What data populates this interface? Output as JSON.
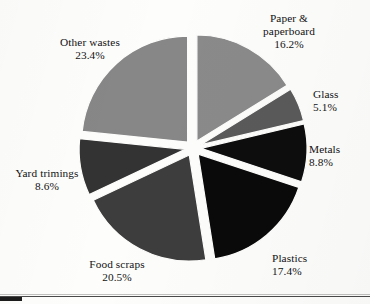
{
  "figure": {
    "background_color": "#fdfdfc",
    "text_color": "#121212"
  },
  "artifacts": {
    "bottom_rule_color": "#4a4a4a",
    "corner_mark_color": "#1c1c1c"
  },
  "chart_data": {
    "type": "pie",
    "title": "",
    "subtitle": "",
    "xlabel": "",
    "ylabel": "",
    "legend_position": "none",
    "grid": false,
    "exploded": true,
    "start_angle_deg": 0,
    "direction": "clockwise",
    "units": "percent",
    "total": 100.0,
    "labels": [
      "Paper & paperboard",
      "Glass",
      "Metals",
      "Plastics",
      "Food scraps",
      "Yard trimings",
      "Other wastes"
    ],
    "values": [
      16.2,
      5.1,
      8.8,
      17.4,
      20.5,
      8.6,
      23.4
    ],
    "colors": [
      "#8a8a8a",
      "#5a5a5a",
      "#0d0d0d",
      "#0a0a0a",
      "#3d3d3d",
      "#333333",
      "#878787"
    ],
    "slices": [
      {
        "label": "Paper & paperboard",
        "label_line1": "Paper &",
        "label_line2": "paperboard",
        "value": 16.2,
        "value_text": "16.2%",
        "color": "#8a8a8a"
      },
      {
        "label": "Glass",
        "label_line1": "Glass",
        "label_line2": "",
        "value": 5.1,
        "value_text": "5.1%",
        "color": "#5a5a5a"
      },
      {
        "label": "Metals",
        "label_line1": "Metals",
        "label_line2": "",
        "value": 8.8,
        "value_text": "8.8%",
        "color": "#0d0d0d"
      },
      {
        "label": "Plastics",
        "label_line1": "Plastics",
        "label_line2": "",
        "value": 17.4,
        "value_text": "17.4%",
        "color": "#0a0a0a"
      },
      {
        "label": "Food scraps",
        "label_line1": "Food scraps",
        "label_line2": "",
        "value": 20.5,
        "value_text": "20.5%",
        "color": "#3d3d3d"
      },
      {
        "label": "Yard trimings",
        "label_line1": "Yard trimings",
        "label_line2": "",
        "value": 8.6,
        "value_text": "8.6%",
        "color": "#333333"
      },
      {
        "label": "Other wastes",
        "label_line1": "Other wastes",
        "label_line2": "",
        "value": 23.4,
        "value_text": "23.4%",
        "color": "#878787"
      }
    ],
    "geometry": {
      "center_x": 193,
      "center_y": 148,
      "radius": 106,
      "explode_offset": 8
    }
  }
}
